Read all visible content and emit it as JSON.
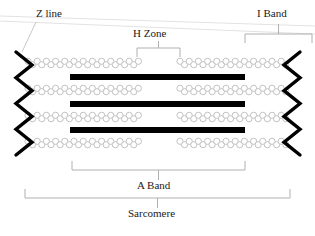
{
  "diagram": {
    "title": "Sarcomere",
    "labels": {
      "z_line": "Z line",
      "h_zone": "H Zone",
      "i_band": "I Band",
      "a_band": "A Band",
      "sarcomere": "Sarcomere"
    },
    "colors": {
      "thick_filament": "#000000",
      "z_line": "#000000",
      "thin_filament_outline": "#b4b4b4",
      "thin_filament_fill": "#ffffff",
      "bracket": "#b0b0b0",
      "text": "#1a1a1a",
      "background": "#ffffff"
    },
    "structure": {
      "thin_filament_rows": 4,
      "thick_filament_rows": 3,
      "thin_filament_row_y": [
        63,
        90,
        117,
        143
      ],
      "thick_filament_row_y": [
        77,
        104,
        130
      ],
      "thick_filament_x_start": 70,
      "thick_filament_x_end": 245,
      "thick_filament_height": 6,
      "h_zone_gap_start": 140,
      "h_zone_gap_end": 180,
      "z_line_left_x": 24,
      "z_line_right_x": 292,
      "z_line_top_y": 52,
      "z_line_bottom_y": 155,
      "z_line_zigzag_segments": 8,
      "z_line_amplitude": 8
    },
    "brackets": {
      "h_zone": {
        "x_start": 137,
        "x_end": 180,
        "y": 48,
        "stem_to_y": 41
      },
      "i_band": {
        "x_start": 245,
        "x_end": 312,
        "y": 34,
        "stem_to_y": 24
      },
      "a_band": {
        "x_start": 72,
        "x_end": 245,
        "y": 170,
        "stem_to_y": 180
      },
      "sarcomere": {
        "x_start": 25,
        "x_end": 290,
        "y": 198,
        "stem_to_y": 208
      }
    },
    "leader_lines": {
      "z_line": {
        "x1": 36,
        "y1": 22,
        "x2": 22,
        "y2": 52
      }
    },
    "scan_artifacts": [
      {
        "x1": 0,
        "y1": 16,
        "x2": 315,
        "y2": 26
      },
      {
        "x1": 0,
        "y1": 21,
        "x2": 315,
        "y2": 34
      }
    ]
  }
}
